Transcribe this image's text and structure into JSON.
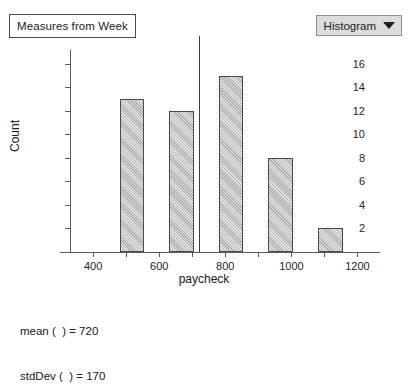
{
  "title_box": {
    "label": "Measures from Week"
  },
  "plot_type_dropdown": {
    "selected": "Histogram",
    "caret_icon": "chevron-down-icon"
  },
  "stats": {
    "mean_line": "mean (  ) = 720",
    "stddev_line": "stdDev (  ) = 170"
  },
  "chart_data": {
    "type": "bar",
    "title": "Measures from Week",
    "xlabel": "paycheck",
    "ylabel": "Count",
    "xlim": [
      330,
      1250
    ],
    "ylim": [
      0,
      17
    ],
    "grid": false,
    "legend": "none",
    "bin_width": 150,
    "bin_starts": [
      480,
      630,
      780,
      930,
      1080
    ],
    "bin_centers": [
      540,
      690,
      840,
      990,
      1140
    ],
    "categories": [
      "480-555",
      "630-705",
      "780-855",
      "930-1005",
      "1080-1155"
    ],
    "values": [
      13,
      12,
      15,
      8,
      2
    ],
    "ytick_values": [
      2,
      4,
      6,
      8,
      10,
      12,
      14,
      16
    ],
    "xtick_values": [
      400,
      600,
      800,
      1000,
      1200
    ],
    "xtick_minor_values": [
      500,
      700,
      900,
      1100
    ],
    "annotations": [
      {
        "name": "mean-reference-line",
        "x": 720,
        "label": "mean = 720"
      }
    ],
    "mean": 720,
    "stdDev": 170
  }
}
